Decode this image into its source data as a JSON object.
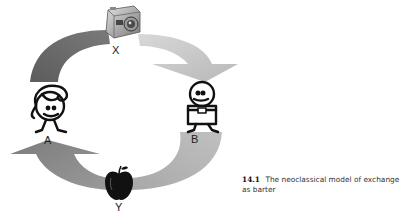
{
  "figure": {
    "number": "14.1",
    "caption": "The neoclassical model of exchange as barter"
  },
  "nodes": {
    "top_good": {
      "label": "X",
      "icon": "camera-icon"
    },
    "bottom_good": {
      "label": "Y",
      "icon": "apple-icon"
    },
    "agent_left": {
      "label": "A",
      "icon": "girl-figure-icon"
    },
    "agent_right": {
      "label": "B",
      "icon": "boy-figure-icon"
    }
  },
  "arrows": [
    {
      "from": "A",
      "to": "X",
      "color": "#6e6e6e"
    },
    {
      "from": "X",
      "to": "B",
      "color": "#c4c4c4"
    },
    {
      "from": "B",
      "to": "Y",
      "color": "#b3b3b3"
    },
    {
      "from": "Y",
      "to": "A",
      "color": "#8a8a8a"
    }
  ]
}
